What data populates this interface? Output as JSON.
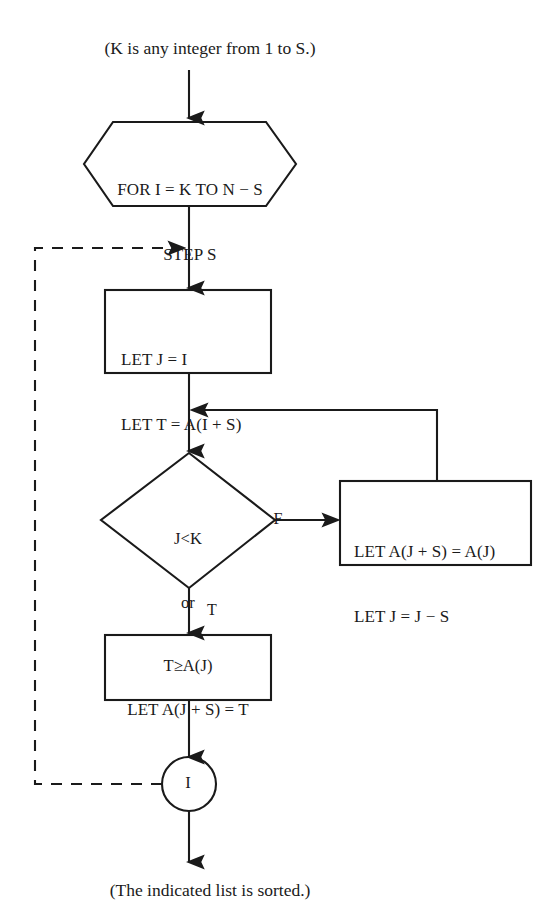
{
  "diagram": {
    "background_color": "#ffffff",
    "stroke_color": "#1a1a1a",
    "captions": {
      "top": "(K is any integer from 1 to S.)",
      "bottom": "(The indicated list is sorted.)"
    },
    "nodes": {
      "loop_header": {
        "shape": "hexagon",
        "line1": "FOR I = K TO N − S",
        "line2": "STEP S"
      },
      "init_box": {
        "shape": "rectangle",
        "line1": "LET J = I",
        "line2": "LET T = A(I + S)"
      },
      "decision": {
        "shape": "diamond",
        "line1": "J<K",
        "line2": "or",
        "line3": "T≥A(J)"
      },
      "shift_box": {
        "shape": "rectangle",
        "line1": "LET A(J + S) = A(J)",
        "line2": "LET J = J − S"
      },
      "place_box": {
        "shape": "rectangle",
        "line1": "LET A(J + S) = T"
      },
      "loop_end": {
        "shape": "circle",
        "label": "I"
      }
    },
    "edge_labels": {
      "false_branch": "F",
      "true_branch": "T"
    }
  }
}
